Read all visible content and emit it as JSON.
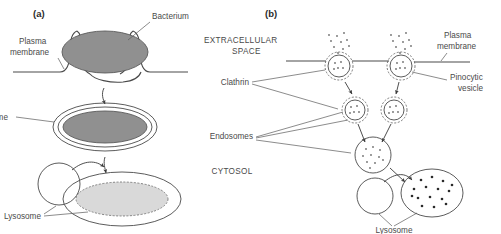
{
  "figure": {
    "panels": [
      {
        "letter": "(a)",
        "process": "phagocytosis",
        "labels": [
          {
            "id": "plasma-membrane",
            "text_line1": "Plasma",
            "text_line2": "membrane"
          },
          {
            "id": "bacterium",
            "text": "Bacterium"
          },
          {
            "id": "phagosome",
            "text": "Phagosome"
          },
          {
            "id": "lysosome",
            "text": "Lysosome"
          }
        ]
      },
      {
        "letter": "(b)",
        "process": "pinocytosis",
        "labels": [
          {
            "id": "extracellular-space",
            "text_line1": "EXTRACELLULAR",
            "text_line2": "SPACE"
          },
          {
            "id": "plasma-membrane",
            "text_line1": "Plasma",
            "text_line2": "membrane"
          },
          {
            "id": "clathrin",
            "text": "Clathrin"
          },
          {
            "id": "pinocytic-vesicle",
            "text_line1": "Pinocytic",
            "text_line2": "vesicle"
          },
          {
            "id": "endosomes",
            "text": "Endosomes"
          },
          {
            "id": "cytosol",
            "text": "CYTOSOL"
          },
          {
            "id": "lysosome",
            "text": "Lysosome"
          }
        ]
      }
    ],
    "colors": {
      "bacterium_fill": "#909090",
      "digested_fill": "#d9d9d9",
      "line": "#4a4a4a",
      "text": "#4a4a4a",
      "background": "#ffffff"
    }
  }
}
